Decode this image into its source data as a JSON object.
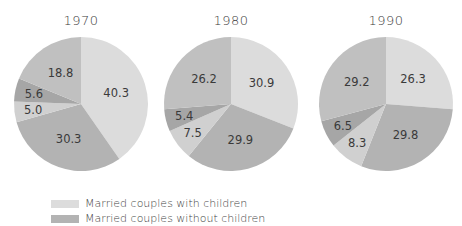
{
  "chart_data": {
    "type": "pie",
    "title": "",
    "legend": {
      "position": "bottom-left",
      "entries": [
        {
          "label": "Married couples with children",
          "color": "#dcdcdc"
        },
        {
          "label": "Married couples without children",
          "color": "#b3b3b3"
        }
      ]
    },
    "slice_colors": [
      "#dcdcdc",
      "#b3b3b3",
      "#d0d0d0",
      "#a6a6a6",
      "#c0c0c0"
    ],
    "charts": [
      {
        "title": "1970",
        "values": [
          40.3,
          30.3,
          5.0,
          5.6,
          18.8
        ]
      },
      {
        "title": "1980",
        "values": [
          30.9,
          29.9,
          7.5,
          5.4,
          26.2
        ]
      },
      {
        "title": "1990",
        "values": [
          26.3,
          29.8,
          8.3,
          6.5,
          29.2
        ]
      }
    ]
  },
  "pies": [
    {
      "title": "1970"
    },
    {
      "title": "1980"
    },
    {
      "title": "1990"
    }
  ],
  "legend": {
    "items": [
      {
        "label": "Married couples with children"
      },
      {
        "label": "Married couples without children"
      }
    ]
  }
}
